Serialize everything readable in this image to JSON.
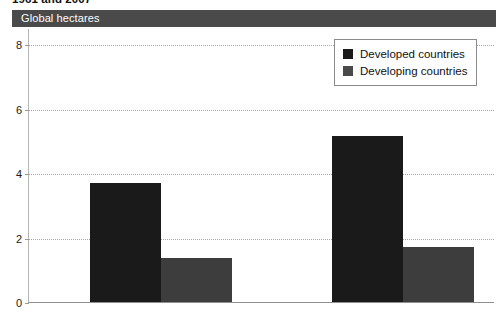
{
  "title": "1961 and 2007",
  "unit_band": {
    "label": "Global hectares"
  },
  "legend": {
    "items": [
      {
        "label": "Developed countries",
        "color": "#1a1a1a",
        "swatch_icon": "square-swatch-icon"
      },
      {
        "label": "Developing countries",
        "color": "#4a4a4a",
        "swatch_icon": "square-swatch-icon"
      }
    ]
  },
  "axes": {
    "y_ticks": [
      "0",
      "2",
      "4",
      "6",
      "8"
    ],
    "x_ticks": [
      "1961",
      "2007"
    ]
  },
  "chart_data": {
    "type": "bar",
    "title": "1961 and 2007",
    "xlabel": "",
    "ylabel": "Global hectares",
    "categories": [
      "1961",
      "2007"
    ],
    "series": [
      {
        "name": "Developed countries",
        "color": "#1a1a1a",
        "values": [
          3.7,
          5.15
        ]
      },
      {
        "name": "Developing countries",
        "color": "#3d3d3d",
        "values": [
          1.35,
          1.7
        ]
      }
    ],
    "ylim": [
      0,
      8.5
    ],
    "yticks": [
      0,
      2,
      4,
      6,
      8
    ],
    "grid": true,
    "grid_style": "dotted-horizontal",
    "legend_position": "top-right"
  }
}
